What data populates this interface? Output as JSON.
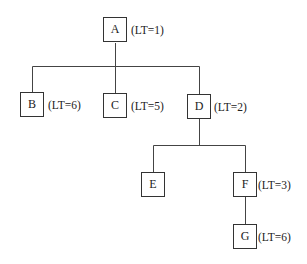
{
  "diagram": {
    "type": "tree",
    "nodes": [
      {
        "id": "A",
        "label": "A",
        "lt": "(LT=1)",
        "parent": null
      },
      {
        "id": "B",
        "label": "B",
        "lt": "(LT=6)",
        "parent": "A"
      },
      {
        "id": "C",
        "label": "C",
        "lt": "(LT=5)",
        "parent": "A"
      },
      {
        "id": "D",
        "label": "D",
        "lt": "(LT=2)",
        "parent": "A"
      },
      {
        "id": "E",
        "label": "E",
        "lt": null,
        "parent": "D"
      },
      {
        "id": "F",
        "label": "F",
        "lt": "(LT=3)",
        "parent": "D"
      },
      {
        "id": "G",
        "label": "G",
        "lt": "(LT=6)",
        "parent": "F"
      }
    ]
  }
}
